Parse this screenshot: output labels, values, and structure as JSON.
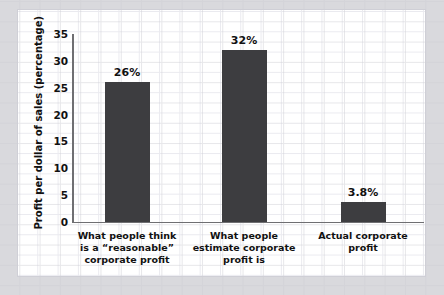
{
  "chart_data": {
    "type": "bar",
    "title": "",
    "xlabel": "",
    "ylabel": "Profit per dollar of sales (percentage)",
    "ylim": [
      0,
      35
    ],
    "ytick_labels": [
      "0",
      "5",
      "10",
      "15",
      "20",
      "25",
      "30",
      "35"
    ],
    "yticks": [
      0,
      5,
      10,
      15,
      20,
      25,
      30,
      35
    ],
    "grid": true,
    "legend": false,
    "categories": [
      "What people think is a “reasonable” corporate profit",
      "What people estimate corporate profit is",
      "Actual corporate profit"
    ],
    "category_lines": [
      [
        "What people think",
        "is a “reasonable”",
        "corporate profit"
      ],
      [
        "What people",
        "estimate corporate",
        "profit is"
      ],
      [
        "Actual corporate",
        "profit"
      ]
    ],
    "values": [
      26,
      32,
      3.8
    ],
    "value_labels": [
      "26%",
      "32%",
      "3.8%"
    ],
    "bar_color": "#3d3d40",
    "axis_color": "#6f6f72",
    "grid_color": "#eaeaef",
    "panel_color": "#ffffff",
    "background_color": "#d9d9dd"
  }
}
